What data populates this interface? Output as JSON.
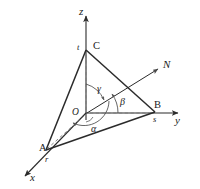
{
  "figure": {
    "background_color": "#ffffff",
    "line_color": "#2b2b2b",
    "dash_color": "#6e6e6e",
    "axes": [
      {
        "name": "x",
        "label": "x",
        "arrow": "down-left"
      },
      {
        "name": "y",
        "label": "y",
        "arrow": "right"
      },
      {
        "name": "z",
        "label": "z",
        "arrow": "up"
      }
    ],
    "vertices": [
      {
        "name": "A",
        "label": "A",
        "intercept_label": "r",
        "axis": "x"
      },
      {
        "name": "B",
        "label": "B",
        "intercept_label": "s",
        "axis": "y"
      },
      {
        "name": "C",
        "label": "C",
        "intercept_label": "t",
        "axis": "z"
      }
    ],
    "origin": {
      "label": "O"
    },
    "normal": {
      "label": "N"
    },
    "angles": [
      {
        "name": "alpha",
        "label": "α",
        "measured_from": "x"
      },
      {
        "name": "beta",
        "label": "β",
        "measured_from": "y"
      },
      {
        "name": "gamma",
        "label": "γ",
        "measured_from": "z"
      }
    ]
  }
}
